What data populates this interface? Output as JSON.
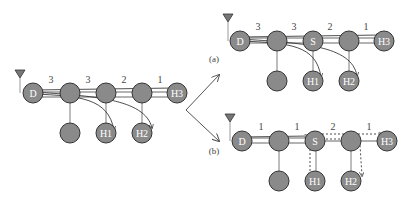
{
  "diagram": {
    "panels": {
      "left": {
        "nodes": [
          "D",
          "",
          "",
          "",
          "H3",
          "",
          "H1",
          "H2"
        ],
        "weights": [
          "3",
          "3",
          "2",
          "1"
        ]
      },
      "a": {
        "label": "(a)",
        "nodes": [
          "D",
          "",
          "S",
          "",
          "H3",
          "",
          "H1",
          "H2"
        ],
        "weights": [
          "3",
          "3",
          "2",
          "1"
        ]
      },
      "b": {
        "label": "(b)",
        "nodes": [
          "D",
          "",
          "S",
          "",
          "H3",
          "",
          "H1",
          "H2"
        ],
        "weights": [
          "1",
          "1",
          "2",
          "1"
        ]
      }
    },
    "colors": {
      "node_fill": "#8a8a8a",
      "node_stroke": "#333333",
      "edge": "#9a9a9a"
    }
  }
}
